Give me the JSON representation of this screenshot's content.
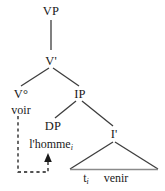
{
  "figure": {
    "type": "syntactic-tree",
    "colors": {
      "line": "#3d3d3d",
      "triangle_base": "#8a8a8a",
      "dashed_movement": "#1a1a1a",
      "text": "#1a1a1a",
      "background": "#ffffff"
    }
  },
  "nodes": {
    "vp": "VP",
    "v_bar": "V'",
    "v_head": "V°",
    "ip": "IP",
    "dp": "DP",
    "i_bar": "I'"
  },
  "terminals": {
    "voir": "voir",
    "lhomme": "l'homme",
    "lhomme_index": "i",
    "trace": "t",
    "trace_index": "i",
    "venir": "venir"
  },
  "movement": {
    "arrow_label": "",
    "style": "dashed",
    "from": "v_head",
    "to": "dp"
  }
}
